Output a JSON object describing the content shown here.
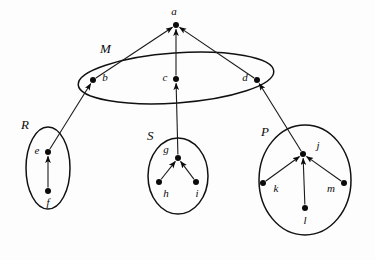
{
  "diagram": {
    "background_color": "#fdfdfd",
    "stroke_color": "#111111",
    "node_fill_color": "#0b0b0b",
    "groups": [
      {
        "id": "M",
        "label": "M",
        "label_x": 100,
        "label_y": 50,
        "cx": 176,
        "cy": 78,
        "rx": 98,
        "ry": 25,
        "rotation": -4
      },
      {
        "id": "R",
        "label": "R",
        "label_x": 21,
        "label_y": 126,
        "cx": 48,
        "cy": 168,
        "rx": 22,
        "ry": 41,
        "rotation": 0
      },
      {
        "id": "S",
        "label": "S",
        "label_x": 147,
        "label_y": 137,
        "cx": 178,
        "cy": 176,
        "rx": 30,
        "ry": 38,
        "rotation": 0
      },
      {
        "id": "P",
        "label": "P",
        "label_x": 261,
        "label_y": 133,
        "cx": 305,
        "cy": 180,
        "rx": 46,
        "ry": 55,
        "rotation": 0
      }
    ],
    "nodes": [
      {
        "id": "a",
        "label": "a",
        "x": 176,
        "y": 25,
        "label_x": 174,
        "label_y": 12,
        "group": null
      },
      {
        "id": "b",
        "label": "b",
        "x": 93,
        "y": 80,
        "label_x": 105,
        "label_y": 78,
        "group": "M"
      },
      {
        "id": "c",
        "label": "c",
        "x": 176,
        "y": 79,
        "label_x": 165,
        "label_y": 78,
        "group": "M"
      },
      {
        "id": "d",
        "label": "d",
        "x": 257,
        "y": 80,
        "label_x": 245,
        "label_y": 78,
        "group": "M"
      },
      {
        "id": "e",
        "label": "e",
        "x": 48,
        "y": 152,
        "label_x": 37,
        "label_y": 151,
        "group": "R"
      },
      {
        "id": "f",
        "label": "f",
        "x": 48,
        "y": 191,
        "label_x": 48,
        "label_y": 203,
        "group": "R"
      },
      {
        "id": "g",
        "label": "g",
        "x": 178,
        "y": 158,
        "label_x": 166,
        "label_y": 150,
        "group": "S"
      },
      {
        "id": "h",
        "label": "h",
        "x": 159,
        "y": 182,
        "label_x": 166,
        "label_y": 194,
        "group": "S"
      },
      {
        "id": "i",
        "label": "i",
        "x": 196,
        "y": 182,
        "label_x": 197,
        "label_y": 194,
        "group": "S"
      },
      {
        "id": "j",
        "label": "j",
        "x": 303,
        "y": 154,
        "label_x": 318,
        "label_y": 146,
        "group": "P"
      },
      {
        "id": "k",
        "label": "k",
        "x": 263,
        "y": 183,
        "label_x": 276,
        "label_y": 189,
        "group": "P"
      },
      {
        "id": "l",
        "label": "l",
        "x": 305,
        "y": 208,
        "label_x": 305,
        "label_y": 221,
        "group": "P"
      },
      {
        "id": "m",
        "label": "m",
        "x": 344,
        "y": 183,
        "label_x": 331,
        "label_y": 189,
        "group": "P"
      }
    ],
    "edges": [
      {
        "id": "b-a",
        "from": "b",
        "to": "a",
        "arrow": true
      },
      {
        "id": "c-a",
        "from": "c",
        "to": "a",
        "arrow": true
      },
      {
        "id": "d-a",
        "from": "d",
        "to": "a",
        "arrow": true
      },
      {
        "id": "e-b",
        "from": "e",
        "to": "b",
        "arrow": true
      },
      {
        "id": "g-c",
        "from": "g",
        "to": "c",
        "arrow": true
      },
      {
        "id": "j-d",
        "from": "j",
        "to": "d",
        "arrow": true
      },
      {
        "id": "f-e",
        "from": "f",
        "to": "e",
        "arrow": true
      },
      {
        "id": "h-g",
        "from": "h",
        "to": "g",
        "arrow": true
      },
      {
        "id": "i-g",
        "from": "i",
        "to": "g",
        "arrow": true
      },
      {
        "id": "k-j",
        "from": "k",
        "to": "j",
        "arrow": true
      },
      {
        "id": "l-j",
        "from": "l",
        "to": "j",
        "arrow": true
      },
      {
        "id": "m-j",
        "from": "m",
        "to": "j",
        "arrow": true
      }
    ]
  }
}
